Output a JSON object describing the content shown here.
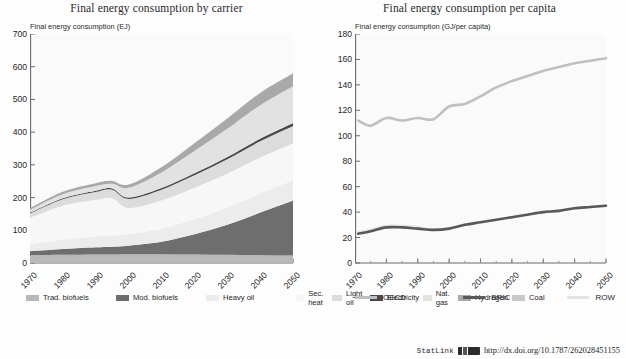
{
  "figure": {
    "statlink": {
      "word": "StatLink",
      "glyph": "barcode-icon",
      "url": "http://dx.doi.org/10.1787/262028451155"
    }
  },
  "chart_data": [
    {
      "type": "area",
      "stacked": true,
      "title": "Final energy consumption by carrier",
      "ylabel": "Final energy consumption (EJ)",
      "xlabel": "",
      "ylim": [
        0,
        700
      ],
      "yticks": [
        0,
        100,
        200,
        300,
        400,
        500,
        600,
        700
      ],
      "xlim": [
        1970,
        2050
      ],
      "xticks": [
        1970,
        1980,
        1990,
        2000,
        2010,
        2020,
        2030,
        2040,
        2050
      ],
      "x": [
        1970,
        1980,
        1990,
        1995,
        2000,
        2010,
        2020,
        2030,
        2040,
        2050
      ],
      "grid": false,
      "legend_position": "bottom",
      "series": [
        {
          "name": "Trad. biofuels",
          "color": "#b8b8b8",
          "values": [
            24,
            25,
            26,
            26,
            27,
            27,
            26,
            25,
            24,
            23
          ]
        },
        {
          "name": "Mod. biofuels",
          "color": "#6e6e6e",
          "values": [
            12,
            18,
            22,
            24,
            26,
            38,
            62,
            92,
            130,
            168
          ]
        },
        {
          "name": "Heavy oil",
          "color": "#ececec",
          "values": [
            22,
            28,
            33,
            34,
            35,
            40,
            46,
            52,
            58,
            62
          ]
        },
        {
          "name": "Sec. heat",
          "color": "#f7f7f7",
          "values": [
            80,
            104,
            112,
            114,
            80,
            86,
            96,
            104,
            110,
            112
          ]
        },
        {
          "name": "Light oil",
          "color": "#dcdcdc",
          "values": [
            14,
            20,
            24,
            26,
            28,
            33,
            38,
            44,
            50,
            54
          ]
        },
        {
          "name": "Electricity",
          "color": "#4a4a4a",
          "values": [
            2,
            3,
            4,
            4,
            4,
            5,
            6,
            7,
            8,
            9
          ]
        },
        {
          "name": "Nat. gas",
          "color": "#e2e2e2",
          "values": [
            8,
            12,
            14,
            14,
            30,
            48,
            68,
            86,
            102,
            112
          ]
        },
        {
          "name": "Hydrogen",
          "color": "#a9a9a9",
          "values": [
            6,
            8,
            9,
            9,
            10,
            16,
            24,
            32,
            38,
            40
          ]
        },
        {
          "name": "Coal",
          "color": "#c9c9c9",
          "values": [
            0,
            0,
            0,
            0,
            0,
            0,
            0,
            0,
            0,
            0
          ]
        }
      ]
    },
    {
      "type": "line",
      "title": "Final energy consumption per capita",
      "ylabel": "Final energy consumption (GJ/per capita)",
      "xlabel": "",
      "ylim": [
        0,
        180
      ],
      "yticks": [
        0,
        20,
        40,
        60,
        80,
        100,
        120,
        140,
        160,
        180
      ],
      "xlim": [
        1970,
        2050
      ],
      "xticks": [
        1970,
        1980,
        1990,
        2000,
        2010,
        2020,
        2030,
        2040,
        2050
      ],
      "x": [
        1971,
        1975,
        1980,
        1985,
        1990,
        1995,
        2000,
        2005,
        2010,
        2015,
        2020,
        2025,
        2030,
        2035,
        2040,
        2045,
        2050
      ],
      "grid": false,
      "legend_position": "bottom",
      "series": [
        {
          "name": "OECD",
          "color": "#c0c0c0",
          "width": 2.6,
          "values": [
            112,
            108,
            114,
            112,
            114,
            113,
            123,
            125,
            131,
            138,
            143,
            147,
            151,
            154,
            157,
            159,
            161
          ]
        },
        {
          "name": "BRIC",
          "color": "#595959",
          "width": 2.6,
          "values": [
            23,
            25,
            28,
            28,
            27,
            26,
            27,
            30,
            32,
            34,
            36,
            38,
            40,
            41,
            43,
            44,
            45
          ]
        },
        {
          "name": "ROW",
          "color": "#e3e3e3",
          "width": 2.6,
          "values": [
            24,
            26,
            29,
            29,
            28,
            26,
            27,
            30,
            32,
            34,
            36,
            38,
            40,
            41,
            43,
            44,
            45
          ]
        }
      ]
    }
  ],
  "left_panel": {
    "title": "Final energy consumption by carrier",
    "ylabel": "Final energy consumption (EJ)",
    "yticks": [
      "700",
      "600",
      "500",
      "400",
      "300",
      "200",
      "100",
      "0"
    ],
    "xticks": [
      "1970",
      "1980",
      "1990",
      "2000",
      "2010",
      "2020",
      "2030",
      "2040",
      "2050"
    ],
    "legend": [
      {
        "label": "Trad. biofuels",
        "color": "#b8b8b8"
      },
      {
        "label": "Mod. biofuels",
        "color": "#6e6e6e"
      },
      {
        "label": "Heavy oil",
        "color": "#ececec"
      },
      {
        "label": "Sec. heat",
        "color": "#f7f7f7"
      },
      {
        "label": "Light oil",
        "color": "#dcdcdc"
      },
      {
        "label": "Electricity",
        "color": "#4a4a4a"
      },
      {
        "label": "Nat. gas",
        "color": "#e2e2e2"
      },
      {
        "label": "Hydrogen",
        "color": "#a9a9a9"
      },
      {
        "label": "Coal",
        "color": "#c9c9c9"
      }
    ]
  },
  "right_panel": {
    "title": "Final energy consumption per capita",
    "ylabel": "Final energy consumption (GJ/per capita)",
    "yticks": [
      "180",
      "160",
      "140",
      "120",
      "100",
      "80",
      "60",
      "40",
      "20",
      "0"
    ],
    "xticks": [
      "1970",
      "1980",
      "1990",
      "2000",
      "2010",
      "2020",
      "2030",
      "2040",
      "2050"
    ],
    "legend": [
      {
        "label": "OECD",
        "color": "#c0c0c0"
      },
      {
        "label": "BRIC",
        "color": "#595959"
      },
      {
        "label": "ROW",
        "color": "#e3e3e3"
      }
    ]
  }
}
